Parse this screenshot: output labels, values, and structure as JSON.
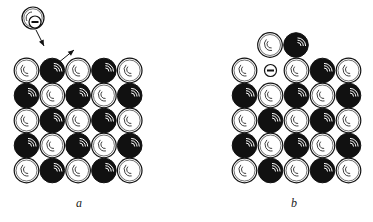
{
  "figure": {
    "panels": [
      {
        "id": "a",
        "label": "a",
        "grid": {
          "rows": 5,
          "cols": 5,
          "origin_x": 14,
          "origin_y": 58,
          "pitch_x": 25.8,
          "pitch_y": 25,
          "cells": [
            [
              "white",
              "black",
              "white",
              "black",
              "white"
            ],
            [
              "black",
              "white",
              "black",
              "white",
              "black"
            ],
            [
              "white",
              "black",
              "white",
              "black",
              "white"
            ],
            [
              "black",
              "white",
              "black",
              "white",
              "black"
            ],
            [
              "white",
              "black",
              "white",
              "black",
              "white"
            ]
          ]
        },
        "incoming_ion": {
          "type": "negative-ion",
          "cx": 33,
          "cy": 18,
          "r": 11,
          "symbol": "−"
        },
        "arrows": [
          {
            "name": "incoming-arrow",
            "x1": 36,
            "y1": 30,
            "x2": 44,
            "y2": 46
          },
          {
            "name": "ejected-arrow",
            "x1": 58,
            "y1": 63,
            "x2": 74,
            "y2": 50
          }
        ]
      },
      {
        "id": "b",
        "label": "b",
        "grid": {
          "rows": 5,
          "cols": 5,
          "origin_x": 232,
          "origin_y": 58,
          "pitch_x": 26,
          "pitch_y": 25,
          "cells": [
            [
              "white",
              "vacancy",
              "white",
              "black",
              "white"
            ],
            [
              "black",
              "white",
              "black",
              "white",
              "black"
            ],
            [
              "white",
              "black",
              "white",
              "black",
              "white"
            ],
            [
              "black",
              "white",
              "black",
              "white",
              "black"
            ],
            [
              "white",
              "black",
              "white",
              "black",
              "white"
            ]
          ]
        },
        "adatoms": [
          {
            "color": "white",
            "cx": 270,
            "cy": 45
          },
          {
            "color": "black",
            "cx": 296,
            "cy": 45
          }
        ],
        "vacancy_symbol": "−"
      }
    ],
    "colors": {
      "black_atom": "#111111",
      "white_atom": "#ffffff",
      "stroke": "#111111"
    }
  }
}
